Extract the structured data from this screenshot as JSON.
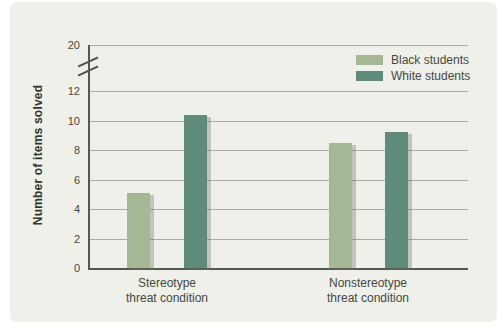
{
  "figure": {
    "ylabel": "Number of items solved"
  },
  "chart_data": {
    "type": "bar",
    "title": "",
    "xlabel": "",
    "ylabel": "Number of items solved",
    "categories": [
      "Stereotype threat condition",
      "Nonstereotype threat condition"
    ],
    "category_label_lines": [
      [
        "Stereotype",
        "threat condition"
      ],
      [
        "Nonstereotype",
        "threat condition"
      ]
    ],
    "series": [
      {
        "name": "Black students",
        "color": "#a5b794",
        "values": [
          5.1,
          8.5
        ]
      },
      {
        "name": "White students",
        "color": "#5e8b7a",
        "values": [
          10.4,
          9.2
        ]
      }
    ],
    "yticks": [
      0,
      2,
      4,
      6,
      8,
      10,
      12
    ],
    "broken_axis_top_tick": 20,
    "axis_break": true,
    "ylim_displayed": [
      0,
      12.6
    ],
    "grid": true,
    "legend_position": "top-right",
    "colors": {
      "panel_background": "#eef0e9",
      "gridline": "#a9aea3",
      "axis": "#55584f",
      "text": "#45483f"
    }
  }
}
